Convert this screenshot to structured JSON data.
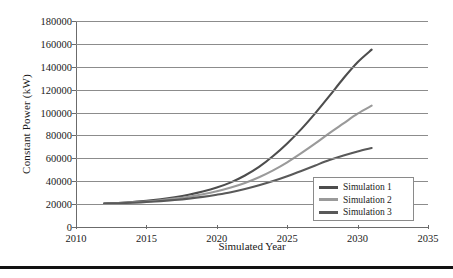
{
  "chart_data": {
    "type": "line",
    "title": "",
    "xlabel": "Simulated Year",
    "ylabel": "Constant Power (kW)",
    "xlim": [
      2010,
      2035
    ],
    "ylim": [
      0,
      180000
    ],
    "xticks": [
      2010,
      2015,
      2020,
      2025,
      2030,
      2035
    ],
    "yticks": [
      0,
      20000,
      40000,
      60000,
      80000,
      100000,
      120000,
      140000,
      160000,
      180000
    ],
    "grid": true,
    "legend_position": "lower-right",
    "x": [
      2012,
      2013,
      2014,
      2015,
      2016,
      2017,
      2018,
      2019,
      2020,
      2021,
      2022,
      2023,
      2024,
      2025,
      2026,
      2027,
      2028,
      2029,
      2030,
      2031
    ],
    "series": [
      {
        "name": "Simulation 1",
        "color": "#4d4d4d",
        "values": [
          20500,
          21000,
          21800,
          22800,
          24200,
          26000,
          28200,
          31000,
          34500,
          39000,
          45000,
          52500,
          62000,
          73000,
          85500,
          99500,
          114500,
          130000,
          144000,
          155000
        ]
      },
      {
        "name": "Simulation 2",
        "color": "#9a9a9a",
        "values": [
          20500,
          20900,
          21500,
          22300,
          23400,
          24800,
          26500,
          28600,
          31200,
          34500,
          38500,
          43500,
          49500,
          56500,
          64500,
          73000,
          82000,
          90500,
          99000,
          106000
        ]
      },
      {
        "name": "Simulation 3",
        "color": "#595959",
        "values": [
          20500,
          20800,
          21200,
          21800,
          22600,
          23600,
          24800,
          26300,
          28200,
          30400,
          33200,
          36500,
          40200,
          44400,
          49000,
          53800,
          58500,
          62500,
          66000,
          69000
        ]
      }
    ]
  },
  "legend": {
    "items": [
      {
        "label": "Simulation 1"
      },
      {
        "label": "Simulation 2"
      },
      {
        "label": "Simulation 3"
      }
    ]
  },
  "colors": {
    "gridline": "#8c8c8c",
    "axis": "#6b6b6b",
    "text": "#1a1a1a",
    "legend_border": "#8a8a8a",
    "bottom_rule": "#111111",
    "background": "#ffffff"
  }
}
